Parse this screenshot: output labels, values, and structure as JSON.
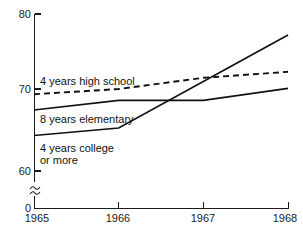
{
  "chart_data": {
    "type": "line",
    "title": "",
    "xlabel": "",
    "ylabel": "",
    "x": [
      1965,
      1966,
      1967,
      1968
    ],
    "xtick_labels": [
      "1965",
      "1966",
      "1967",
      "1968"
    ],
    "ytick_labels": [
      "0",
      "60",
      "70",
      "80"
    ],
    "ytick_values": [
      0,
      60,
      70,
      80
    ],
    "ylim": [
      60,
      80
    ],
    "xlim": [
      1965,
      1968
    ],
    "axis_break": true,
    "axis_break_label": "≈",
    "grid": false,
    "legend": "inline-labels",
    "series": [
      {
        "name": "4 years high school",
        "label": "4 years high school",
        "style": "dashed",
        "color": "#111111",
        "x": [
          1965,
          1966,
          1967,
          1968
        ],
        "values": [
          69.3,
          70.0,
          71.5,
          72.3
        ]
      },
      {
        "name": "8 years elementary",
        "label": "8 years elementary",
        "style": "solid",
        "color": "#111111",
        "x": [
          1965,
          1966,
          1967,
          1968
        ],
        "values": [
          67.2,
          68.5,
          68.5,
          70.1
        ]
      },
      {
        "name": "4 years college or more",
        "label_line1": "4 years college",
        "label_line2": "or more",
        "style": "solid",
        "color": "#111111",
        "x": [
          1965,
          1966,
          1968
        ],
        "values": [
          63.8,
          64.8,
          77.2
        ]
      }
    ]
  },
  "labels": {
    "y_80": "80",
    "y_70": "70",
    "y_60": "60",
    "y_0": "0",
    "x_1965": "1965",
    "x_1966": "1966",
    "x_1967": "1967",
    "x_1968": "1968",
    "series_high_school": "4 years high school",
    "series_elementary": "8 years elementary",
    "series_college_line1": "4 years college",
    "series_college_line2": "or more"
  }
}
